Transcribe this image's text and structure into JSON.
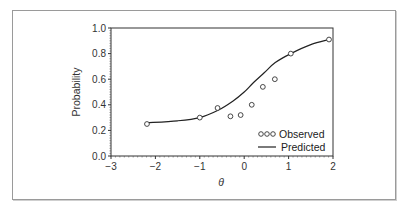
{
  "chart_data": {
    "type": "line",
    "title": "",
    "xlabel": "θ",
    "ylabel": "Probability",
    "xlim": [
      -3,
      2
    ],
    "ylim": [
      0,
      1.0
    ],
    "x_ticks": [
      "−3",
      "−2",
      "−1",
      "0",
      "1",
      "2"
    ],
    "y_ticks": [
      "0.0",
      "0.2",
      "0.4",
      "0.6",
      "0.8",
      "1.0"
    ],
    "grid": false,
    "legend_position": "lower right",
    "series": [
      {
        "name": "Observed",
        "style": "markers-open-circle",
        "x": [
          -2.19,
          -1.0,
          -0.6,
          -0.31,
          -0.08,
          0.17,
          0.42,
          0.69,
          1.05,
          1.91
        ],
        "y": [
          0.25,
          0.3,
          0.375,
          0.31,
          0.32,
          0.4,
          0.54,
          0.6,
          0.8,
          0.91
        ]
      },
      {
        "name": "Predicted",
        "style": "line",
        "x": [
          -2.19,
          -1.5,
          -1.0,
          -0.6,
          -0.25,
          0.0,
          0.2,
          0.45,
          0.7,
          1.05,
          1.5,
          1.91
        ],
        "y": [
          0.26,
          0.275,
          0.3,
          0.355,
          0.43,
          0.5,
          0.57,
          0.65,
          0.73,
          0.8,
          0.87,
          0.91
        ]
      }
    ]
  },
  "legend": {
    "observed_label": "Observed",
    "predicted_label": "Predicted"
  },
  "axes": {
    "xlabel": "θ",
    "ylabel": "Probability",
    "x_ticks": [
      "−3",
      "−2",
      "−1",
      "0",
      "1",
      "2"
    ],
    "y_ticks": [
      "0.0",
      "0.2",
      "0.4",
      "0.6",
      "0.8",
      "1.0"
    ]
  }
}
